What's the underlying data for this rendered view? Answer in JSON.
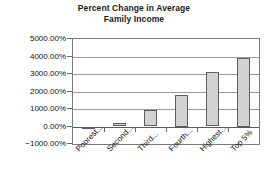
{
  "chart_data": {
    "type": "bar",
    "title": "Percent Change in Average Family Income",
    "title_lines": [
      "Percent Change in Average",
      "Family Income"
    ],
    "xlabel": "",
    "ylabel": "",
    "categories": [
      "Poorest...",
      "Second...",
      "Third...",
      "Fourth...",
      "Highest...",
      "Top 5%"
    ],
    "values": [
      -70,
      180,
      920,
      1800,
      3110,
      3900
    ],
    "value_labels": [
      "-70.00%",
      "180.00%",
      "920.00%",
      "1800.00%",
      "3110.00%",
      "3900.00%"
    ],
    "ylim": [
      -1000,
      5000
    ],
    "ytick_values": [
      5000,
      4000,
      3000,
      2000,
      1000,
      0,
      -1000
    ],
    "ytick_labels": [
      "5000.00%",
      "4000.00%",
      "3000.00%",
      "2000.00%",
      "1000.00%",
      "0.00%",
      "−1000.00%"
    ],
    "grid": true,
    "grid_axis": "y",
    "legend": false,
    "legend_position": "none",
    "series": [
      {
        "name": "Percent Change in Average Family Income",
        "values": [
          -70,
          180,
          920,
          1800,
          3110,
          3900
        ]
      }
    ],
    "colors": {
      "bar_fill": "#d2d2d2",
      "bar_border": "#5e5e5e",
      "gridline": "#9a9a9a",
      "axis": "#7a7a7a",
      "text": "#111111",
      "background": "#ffffff"
    }
  }
}
